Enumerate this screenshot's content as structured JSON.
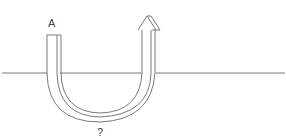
{
  "diagram": {
    "label_start": "A",
    "label_bottom": "?",
    "line_color": "#7a7a7a"
  }
}
